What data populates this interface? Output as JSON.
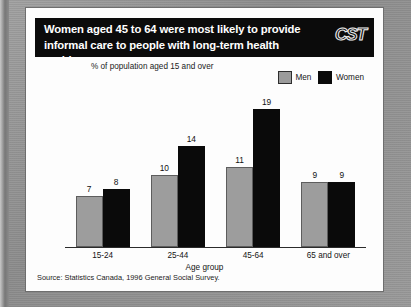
{
  "banner": {
    "title": "Women aged 45 to 64 were most likely to provide informal care to people with long-term health problems",
    "logo": "CST"
  },
  "chart_data": {
    "type": "bar",
    "title": "Women aged 45 to 64 were most likely to provide informal care to people with long-term health problems",
    "ylabel": "% of population aged 15 and over",
    "xlabel": "Age group",
    "categories": [
      "15-24",
      "25-44",
      "45-64",
      "65 and over"
    ],
    "series": [
      {
        "name": "Men",
        "values": [
          7,
          10,
          11,
          9
        ],
        "color": "#9d9d9d"
      },
      {
        "name": "Women",
        "values": [
          8,
          14,
          19,
          9
        ],
        "color": "#0a0a0a"
      }
    ],
    "ylim": [
      0,
      20
    ],
    "grid": false,
    "legend_position": "top-right",
    "source": "Source: Statistics Canada, 1996 General Social Survey."
  },
  "source": "Source: Statistics Canada, 1996 General Social Survey."
}
